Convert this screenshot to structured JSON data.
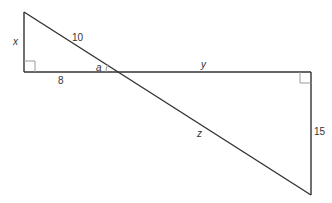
{
  "diagram": {
    "colors": {
      "line": "#333333",
      "right_angle_marker": "#9a9a9a",
      "background": "#ffffff"
    },
    "labels": {
      "x": "x",
      "hyp_small": "10",
      "base_small": "8",
      "angle": "a",
      "y": "y",
      "z": "z",
      "side_large": "15"
    },
    "triangles": [
      {
        "name": "small-triangle",
        "legs": {
          "vertical": "x",
          "horizontal": "8"
        },
        "hypotenuse": "10",
        "right_angle_at": "bottom-left"
      },
      {
        "name": "large-triangle",
        "legs": {
          "horizontal": "y",
          "vertical": "15"
        },
        "hypotenuse": "z",
        "right_angle_at": "top-right"
      }
    ]
  }
}
